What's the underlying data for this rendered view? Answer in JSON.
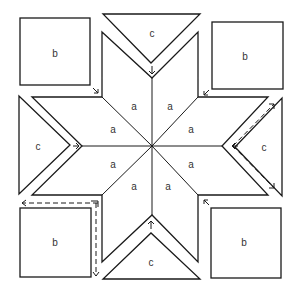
{
  "diagram": {
    "type": "quilt-block-assembly",
    "labels": {
      "diamond": "a",
      "square": "b",
      "triangle": "c"
    },
    "diamonds": [
      {
        "id": "a1",
        "label": "a"
      },
      {
        "id": "a2",
        "label": "a"
      },
      {
        "id": "a3",
        "label": "a"
      },
      {
        "id": "a4",
        "label": "a"
      },
      {
        "id": "a5",
        "label": "a"
      },
      {
        "id": "a6",
        "label": "a"
      },
      {
        "id": "a7",
        "label": "a"
      },
      {
        "id": "a8",
        "label": "a"
      }
    ],
    "squares": [
      {
        "id": "b-top-left",
        "label": "b"
      },
      {
        "id": "b-top-right",
        "label": "b"
      },
      {
        "id": "b-bottom-left",
        "label": "b"
      },
      {
        "id": "b-bottom-right",
        "label": "b"
      }
    ],
    "triangles": [
      {
        "id": "c-top",
        "label": "c"
      },
      {
        "id": "c-left",
        "label": "c"
      },
      {
        "id": "c-right",
        "label": "c"
      },
      {
        "id": "c-bottom",
        "label": "c"
      }
    ],
    "colors": {
      "line": "#1a1a1a",
      "background": "#ffffff",
      "text": "#333333"
    }
  }
}
